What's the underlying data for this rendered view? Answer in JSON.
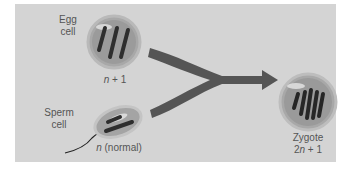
{
  "diagram": {
    "egg": {
      "title_line1": "Egg",
      "title_line2": "cell",
      "ploidy_var": "n",
      "ploidy_rest": " + 1"
    },
    "sperm": {
      "title_line1": "Sperm",
      "title_line2": "cell",
      "ploidy_var": "n",
      "ploidy_rest": " (normal)"
    },
    "zygote": {
      "title": "Zygote",
      "ploidy_prefix": "2",
      "ploidy_var": "n",
      "ploidy_rest": " + 1"
    },
    "colors": {
      "panel": "#d4d4d4",
      "arrow": "#555555",
      "cell_fill": "#9a9a9a",
      "chromosome": "#333333",
      "text": "#555555"
    }
  }
}
